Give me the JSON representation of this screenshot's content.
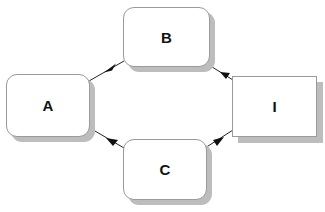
{
  "diagram": {
    "type": "directed-graph",
    "nodes": [
      {
        "id": "A",
        "label": "A",
        "shape": "rounded-rect",
        "x": 6,
        "y": 74,
        "w": 84,
        "h": 63
      },
      {
        "id": "B",
        "label": "B",
        "shape": "rounded-rect",
        "x": 123,
        "y": 7,
        "w": 87,
        "h": 60
      },
      {
        "id": "C",
        "label": "C",
        "shape": "rounded-rect",
        "x": 123,
        "y": 139,
        "w": 84,
        "h": 61
      },
      {
        "id": "I",
        "label": "I",
        "shape": "rect",
        "x": 232,
        "y": 76,
        "w": 85,
        "h": 61
      }
    ],
    "edges": [
      {
        "from": "B",
        "to": "A",
        "x1": 124,
        "y1": 61,
        "x2": 89,
        "y2": 81
      },
      {
        "from": "I",
        "to": "B",
        "x1": 233,
        "y1": 80,
        "x2": 209,
        "y2": 65
      },
      {
        "from": "C",
        "to": "A",
        "x1": 124,
        "y1": 148,
        "x2": 95,
        "y2": 131
      },
      {
        "from": "I",
        "to": "C",
        "x1": 233,
        "y1": 130,
        "x2": 205,
        "y2": 148
      }
    ],
    "colors": {
      "node_fill": "#ffffff",
      "node_border": "#9a9a9a",
      "shadow": "#bdbdbd",
      "edge": "#222222",
      "text": "#111111"
    }
  }
}
